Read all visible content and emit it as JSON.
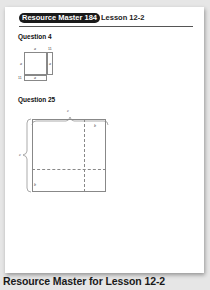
{
  "header": {
    "badge": "Resource Master 184",
    "lesson": "Lesson 12-2"
  },
  "questions": [
    {
      "title": "Question 4",
      "figure": {
        "labels": {
          "top": "a",
          "top_right": "11",
          "left": "a",
          "right": "a",
          "bottom_left": "11",
          "bottom": "a"
        }
      }
    },
    {
      "title": "Question 25",
      "figure": {
        "labels": {
          "top": "c",
          "left": "c",
          "inner_top_right": "b",
          "inner_bottom_left": "b"
        }
      }
    }
  ],
  "caption": "Resource Master for Lesson 12-2"
}
